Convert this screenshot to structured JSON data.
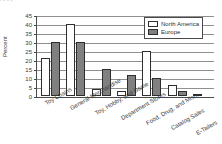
{
  "top_clip_text": "i                    o           o                    y",
  "chart_data": {
    "type": "bar",
    "title": "",
    "xlabel": "",
    "ylabel": "Percent",
    "ylim": [
      0,
      45
    ],
    "ytick_step": 5,
    "yticks": [
      0,
      5,
      10,
      15,
      20,
      25,
      30,
      35,
      40,
      45
    ],
    "ytick_labels": [
      "0",
      "5",
      "10",
      "15",
      "20",
      "25",
      "30",
      "35",
      "40",
      "45"
    ],
    "grid": true,
    "legend_position": "top-right",
    "categories": [
      "Toy Chains",
      "General Merchandise",
      "Toy, Hobby, and Game",
      "Department Stores",
      "Food, Drug, and Misc.",
      "Catalog Sales",
      "E-Tailers"
    ],
    "series": [
      {
        "name": "North America",
        "color": "#ffffff",
        "values": [
          21,
          40,
          4,
          3,
          25,
          6,
          1
        ]
      },
      {
        "name": "Europe",
        "color": "#808080",
        "values": [
          30,
          30,
          15,
          11.5,
          10,
          3,
          0
        ]
      }
    ]
  },
  "legend": {
    "items": [
      {
        "label": "North America"
      },
      {
        "label": "Europe"
      }
    ]
  }
}
